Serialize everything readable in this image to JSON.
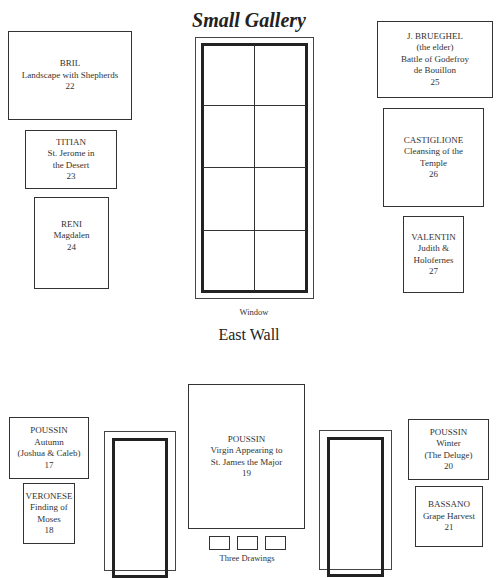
{
  "title": "Small Gallery",
  "east_wall": {
    "label": "East Wall",
    "window_label": "Window",
    "paintings": [
      {
        "id": "bril",
        "artist": "BRIL",
        "lines": [
          "Landscape with Shepherds"
        ],
        "number": "22"
      },
      {
        "id": "titian",
        "artist": "TITIAN",
        "lines": [
          "St. Jerome in",
          "the Desert"
        ],
        "number": "23"
      },
      {
        "id": "reni",
        "artist": "RENI",
        "lines": [
          "Magdalen"
        ],
        "number": "24"
      },
      {
        "id": "brueghel",
        "artist": "J. BRUEGHEL",
        "lines": [
          "(the elder)",
          "Battle of Godefroy",
          "de Bouillon"
        ],
        "number": "25"
      },
      {
        "id": "castiglione",
        "artist": "CASTIGLIONE",
        "lines": [
          "Cleansing of the",
          "Temple"
        ],
        "number": "26"
      },
      {
        "id": "valentin",
        "artist": "VALENTIN",
        "lines": [
          "Judith &",
          "Holofernes"
        ],
        "number": "27"
      }
    ]
  },
  "south_wall": {
    "drawings_label": "Three Drawings",
    "paintings": [
      {
        "id": "poussin-autumn",
        "artist": "POUSSIN",
        "lines": [
          "Autumn",
          "(Joshua & Caleb)"
        ],
        "number": "17"
      },
      {
        "id": "veronese",
        "artist": "VERONESE",
        "lines": [
          "Finding of",
          "Moses"
        ],
        "number": "18"
      },
      {
        "id": "poussin-virgin",
        "artist": "POUSSIN",
        "lines": [
          "Virgin Appearing to",
          "St. James the Major"
        ],
        "number": "19"
      },
      {
        "id": "poussin-winter",
        "artist": "POUSSIN",
        "lines": [
          "Winter",
          "(The Deluge)"
        ],
        "number": "20"
      },
      {
        "id": "bassano",
        "artist": "BASSANO",
        "lines": [
          "Grape Harvest"
        ],
        "number": "21"
      }
    ]
  }
}
